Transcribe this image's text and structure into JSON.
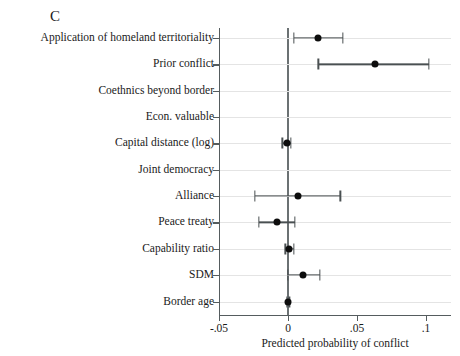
{
  "panel": {
    "letter": "C"
  },
  "axis": {
    "x_title": "Predicted probability of conflict",
    "x_ticks": [
      "-.05",
      "0",
      ".05",
      ".1"
    ],
    "x_tick_values": [
      -0.05,
      0,
      0.05,
      0.1
    ]
  },
  "chart_data": {
    "type": "scatter",
    "title": "C",
    "xlabel": "Predicted probability of conflict",
    "ylabel": "",
    "xlim": [
      -0.065,
      0.118
    ],
    "xticks": [
      -0.05,
      0,
      0.05,
      0.1
    ],
    "xticklabels": [
      "-.05",
      "0",
      ".05",
      ".1"
    ],
    "grid": "horizontal",
    "legend": "none",
    "orientation": "horizontal-coefficient-plot",
    "reference_line": 0,
    "categories": [
      "Application of homeland territoriality",
      "Prior conflict",
      "Coethnics beyond border",
      "Econ. valuable",
      "Capital distance (log)",
      "Joint democracy",
      "Alliance",
      "Peace treaty",
      "Capability ratio",
      "SDM",
      "Border age"
    ],
    "values": [
      0.022,
      0.063,
      null,
      null,
      -0.001,
      null,
      0.007,
      -0.008,
      0.001,
      0.011,
      0.0
    ],
    "ci_low": [
      0.004,
      0.022,
      null,
      null,
      -0.004,
      null,
      -0.024,
      -0.021,
      -0.002,
      0.0,
      -0.001
    ],
    "ci_high": [
      0.04,
      0.102,
      null,
      null,
      0.002,
      null,
      0.038,
      0.005,
      0.004,
      0.023,
      0.001
    ],
    "points": [
      {
        "label": "Application of homeland territoriality",
        "estimate": 0.022,
        "ci_low": 0.004,
        "ci_high": 0.04
      },
      {
        "label": "Prior conflict",
        "estimate": 0.063,
        "ci_low": 0.022,
        "ci_high": 0.102
      },
      {
        "label": "Coethnics beyond border",
        "estimate": null,
        "ci_low": null,
        "ci_high": null
      },
      {
        "label": "Econ. valuable",
        "estimate": null,
        "ci_low": null,
        "ci_high": null
      },
      {
        "label": "Capital distance (log)",
        "estimate": -0.001,
        "ci_low": -0.004,
        "ci_high": 0.002
      },
      {
        "label": "Joint democracy",
        "estimate": null,
        "ci_low": null,
        "ci_high": null
      },
      {
        "label": "Alliance",
        "estimate": 0.007,
        "ci_low": -0.024,
        "ci_high": 0.038
      },
      {
        "label": "Peace treaty",
        "estimate": -0.008,
        "ci_low": -0.021,
        "ci_high": 0.005
      },
      {
        "label": "Capability ratio",
        "estimate": 0.001,
        "ci_low": -0.002,
        "ci_high": 0.004
      },
      {
        "label": "SDM",
        "estimate": 0.011,
        "ci_low": 0.0,
        "ci_high": 0.023
      },
      {
        "label": "Border age",
        "estimate": 0.0,
        "ci_low": -0.001,
        "ci_high": 0.001
      }
    ]
  },
  "colors": {
    "point": "#0d0d0d",
    "interval": "#4a5052",
    "axis": "#555c5e",
    "grid": "#e4e4e4",
    "zero_line": "#6b7173",
    "background": "#ffffff",
    "text": "#1a1a1a"
  }
}
